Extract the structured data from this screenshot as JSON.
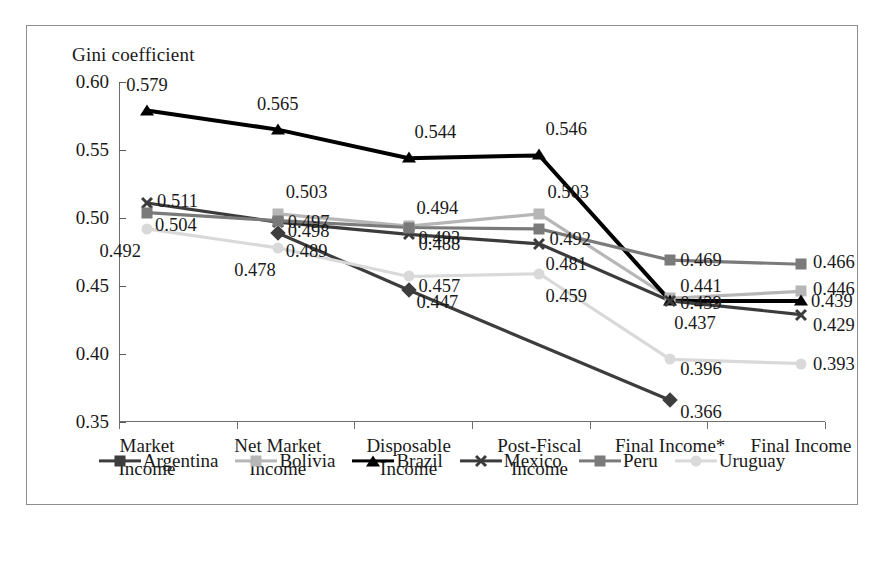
{
  "chart_data": {
    "type": "line",
    "title": "Gini coefficient",
    "xlabel": "",
    "ylabel": "Gini coefficient",
    "ylim": [
      0.35,
      0.6
    ],
    "ytick_labels": [
      "0.60",
      "0.55",
      "0.50",
      "0.45",
      "0.40",
      "0.35"
    ],
    "ytick_values": [
      0.6,
      0.55,
      0.5,
      0.45,
      0.4,
      0.35
    ],
    "grid": false,
    "legend_position": "bottom",
    "categories": [
      "Market\nIncome",
      "Net Market\nIncome",
      "Disposable\nIncome",
      "Post-Fiscal\nIncome",
      "Final Income*",
      "Final Income"
    ],
    "category_lines": [
      [
        "Market",
        "Income"
      ],
      [
        "Net Market",
        "Income"
      ],
      [
        "Disposable",
        "Income"
      ],
      [
        "Post-Fiscal",
        "Income"
      ],
      [
        "Final Income*",
        ""
      ],
      [
        "Final Income",
        ""
      ]
    ],
    "series": [
      {
        "name": "Argentina",
        "marker": "diamond",
        "color": "#3d3d3d",
        "values": [
          null,
          0.489,
          0.447,
          null,
          0.366,
          null
        ],
        "labels": [
          "",
          "0.489",
          "0.447",
          "",
          "0.366",
          ""
        ]
      },
      {
        "name": "Bolivia",
        "marker": "square",
        "color": "#b6b6b6",
        "values": [
          null,
          0.503,
          0.494,
          0.503,
          0.441,
          0.446
        ],
        "labels": [
          "",
          "0.503",
          "0.494",
          "0.503",
          "0.441",
          "0.446"
        ]
      },
      {
        "name": "Brazil",
        "marker": "triangle",
        "color": "#000000",
        "values": [
          0.579,
          0.565,
          0.544,
          0.546,
          0.439,
          0.439
        ],
        "labels": [
          "0.579",
          "0.565",
          "0.544",
          "0.546",
          "0.439",
          "0.439"
        ]
      },
      {
        "name": "Mexico",
        "marker": "x",
        "color": "#3b3b3b",
        "values": [
          0.511,
          0.497,
          0.488,
          0.481,
          0.439,
          0.429
        ],
        "labels": [
          "0.511",
          "0.497",
          "0.488",
          "0.481",
          "0.437",
          "0.429"
        ]
      },
      {
        "name": "Peru",
        "marker": "square",
        "color": "#7a7a7a",
        "values": [
          0.504,
          0.498,
          0.493,
          0.492,
          0.469,
          0.466
        ],
        "labels": [
          "0.504",
          "0.498",
          "0.493",
          "0.492",
          "0.469",
          "0.466"
        ]
      },
      {
        "name": "Uruguay",
        "marker": "circle",
        "color": "#d9d9d9",
        "values": [
          0.492,
          0.478,
          0.457,
          0.459,
          0.396,
          0.393
        ],
        "labels": [
          "0.492",
          "0.478",
          "0.457",
          "0.459",
          "0.396",
          "0.393"
        ]
      }
    ],
    "annotations": [
      {
        "text": "0.579",
        "x": 0,
        "y": 0.579,
        "series": "Brazil"
      },
      {
        "text": "0.565",
        "x": 1,
        "y": 0.565,
        "series": "Brazil"
      },
      {
        "text": "0.544",
        "x": 2,
        "y": 0.544,
        "series": "Brazil"
      },
      {
        "text": "0.546",
        "x": 3,
        "y": 0.546,
        "series": "Brazil"
      },
      {
        "text": "0.511",
        "x": 0,
        "y": 0.511,
        "series": "Mexico"
      },
      {
        "text": "0.504",
        "x": 0,
        "y": 0.504,
        "series": "Peru"
      },
      {
        "text": "0.492",
        "x": 0,
        "y": 0.492,
        "series": "Uruguay"
      },
      {
        "text": "0.503",
        "x": 1,
        "y": 0.503,
        "series": "Bolivia"
      },
      {
        "text": "0.498",
        "x": 1,
        "y": 0.498,
        "series": "Peru"
      },
      {
        "text": "0.497",
        "x": 1,
        "y": 0.497,
        "series": "Mexico"
      },
      {
        "text": "0.489",
        "x": 1,
        "y": 0.489,
        "series": "Argentina"
      },
      {
        "text": "0.478",
        "x": 1,
        "y": 0.478,
        "series": "Uruguay"
      },
      {
        "text": "0.494",
        "x": 2,
        "y": 0.494,
        "series": "Bolivia"
      },
      {
        "text": "0.493",
        "x": 2,
        "y": 0.493,
        "series": "Peru"
      },
      {
        "text": "0.488",
        "x": 2,
        "y": 0.488,
        "series": "Mexico"
      },
      {
        "text": "0.457",
        "x": 2,
        "y": 0.457,
        "series": "Uruguay"
      },
      {
        "text": "0.447",
        "x": 2,
        "y": 0.447,
        "series": "Argentina"
      },
      {
        "text": "0.503",
        "x": 3,
        "y": 0.503,
        "series": "Bolivia"
      },
      {
        "text": "0.492",
        "x": 3,
        "y": 0.492,
        "series": "Peru"
      },
      {
        "text": "0.481",
        "x": 3,
        "y": 0.481,
        "series": "Mexico"
      },
      {
        "text": "0.459",
        "x": 3,
        "y": 0.459,
        "series": "Uruguay"
      },
      {
        "text": "0.469",
        "x": 4,
        "y": 0.469,
        "series": "Peru"
      },
      {
        "text": "0.441",
        "x": 4,
        "y": 0.441,
        "series": "Bolivia"
      },
      {
        "text": "0.439",
        "x": 4,
        "y": 0.439,
        "series": "Brazil"
      },
      {
        "text": "0.437",
        "x": 4,
        "y": 0.437,
        "series": "Mexico"
      },
      {
        "text": "0.396",
        "x": 4,
        "y": 0.396,
        "series": "Uruguay"
      },
      {
        "text": "0.366",
        "x": 4,
        "y": 0.366,
        "series": "Argentina"
      },
      {
        "text": "0.466",
        "x": 5,
        "y": 0.466,
        "series": "Peru"
      },
      {
        "text": "0.446",
        "x": 5,
        "y": 0.446,
        "series": "Bolivia"
      },
      {
        "text": "0.439",
        "x": 5,
        "y": 0.439,
        "series": "Brazil"
      },
      {
        "text": "0.429",
        "x": 5,
        "y": 0.429,
        "series": "Mexico"
      },
      {
        "text": "0.393",
        "x": 5,
        "y": 0.393,
        "series": "Uruguay"
      }
    ]
  },
  "legend": {
    "items": [
      {
        "label": "Argentina",
        "marker": "diamond",
        "color": "#3d3d3d"
      },
      {
        "label": "Bolivia",
        "marker": "square",
        "color": "#b6b6b6"
      },
      {
        "label": "Brazil",
        "marker": "triangle",
        "color": "#000000"
      },
      {
        "label": "Mexico",
        "marker": "x",
        "color": "#3b3b3b"
      },
      {
        "label": "Peru",
        "marker": "square",
        "color": "#7a7a7a"
      },
      {
        "label": "Uruguay",
        "marker": "circle",
        "color": "#d9d9d9"
      }
    ]
  }
}
